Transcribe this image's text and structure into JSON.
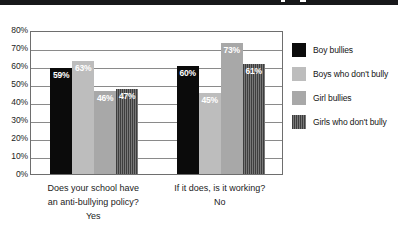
{
  "top_strip": {
    "present": true,
    "color": "#17181a"
  },
  "chart_data": {
    "type": "bar",
    "title": "",
    "subtitle": "",
    "xlabel": "",
    "ylabel": "",
    "ylim": [
      0,
      80
    ],
    "y_unit": "%",
    "grid": true,
    "legend_position": "right",
    "categories": [
      "Does your school have an anti-bullying policy? Yes",
      "If it does, is it working? No"
    ],
    "category_lines": [
      [
        "Does your school have",
        "an anti-bullying policy?",
        "Yes"
      ],
      [
        "If it does, is it working?",
        "No"
      ]
    ],
    "y_ticks": [
      "0%",
      "10%",
      "20%",
      "30%",
      "40%",
      "50%",
      "60%",
      "70%",
      "80%"
    ],
    "y_tick_values": [
      0,
      10,
      20,
      30,
      40,
      50,
      60,
      70,
      80
    ],
    "series": [
      {
        "name": "Boy bullies",
        "color": "#0b0b0b",
        "pattern": "solid",
        "values": [
          59,
          60
        ],
        "labels": [
          "59%",
          "60%"
        ]
      },
      {
        "name": "Boys who don't bully",
        "color": "#bdbdbd",
        "pattern": "solid",
        "values": [
          63,
          45
        ],
        "labels": [
          "63%",
          "45%"
        ]
      },
      {
        "name": "Girl bullies",
        "color": "#a8a8a8",
        "pattern": "solid",
        "values": [
          46,
          73
        ],
        "labels": [
          "46%",
          "73%"
        ]
      },
      {
        "name": "Girls who don't bully",
        "color": "#5e5e5e",
        "pattern": "vertical-hatch",
        "values": [
          47,
          61
        ],
        "labels": [
          "47%",
          "61%"
        ]
      }
    ]
  }
}
